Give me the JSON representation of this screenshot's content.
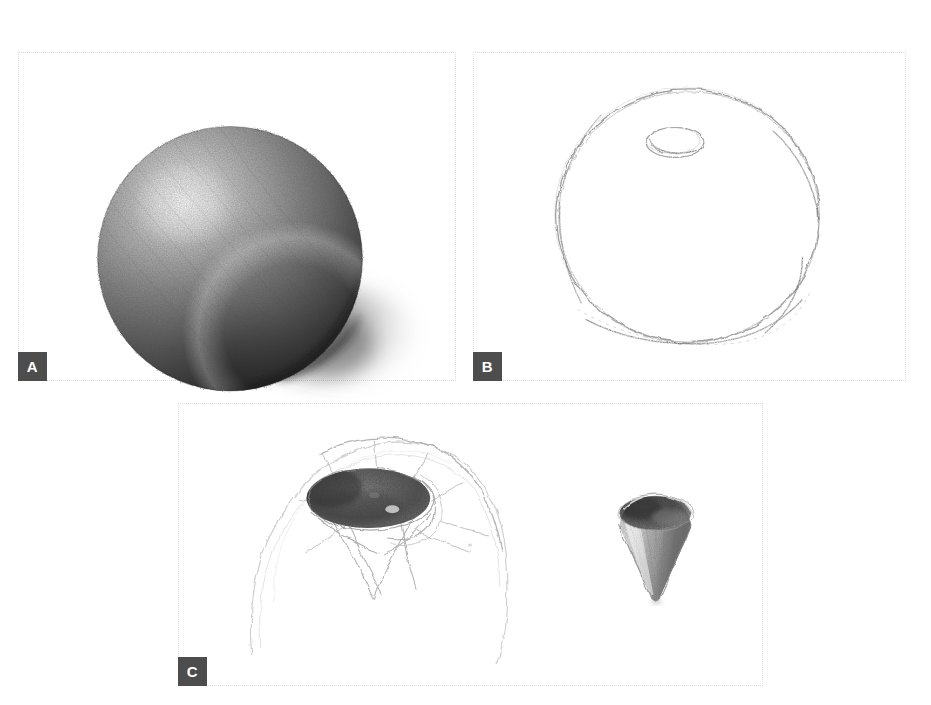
{
  "figure": {
    "kind": "pencil-drawing-plate",
    "background_color": "#ffffff",
    "panel_border_color": "#dcdcdc",
    "badge_background": "#4d4d4d",
    "badge_text_color": "#ffffff",
    "graphite_dark": "#2b2b2b",
    "graphite_mid": "#6e6e6e",
    "graphite_light": "#b9b9b9",
    "outline_gray": "#9a9a9a"
  },
  "panels": [
    {
      "id": "A",
      "label": "A",
      "badge_label": "A",
      "caption": "",
      "frame": {
        "x": 18,
        "y": 52,
        "w": 438,
        "h": 329
      },
      "content_name": "shaded-sphere",
      "subjects": [
        {
          "name": "sphere",
          "shape": "sphere",
          "cx": 212,
          "cy": 207,
          "rx": 133,
          "ry": 133,
          "highlight": {
            "cx": 165,
            "cy": 150,
            "r": 52
          },
          "value_range": [
            "#f2f2f2",
            "#1d1d1d"
          ]
        },
        {
          "name": "cast-shadow",
          "shape": "ellipse",
          "cx": 330,
          "cy": 285,
          "rx": 68,
          "ry": 46
        }
      ]
    },
    {
      "id": "B",
      "label": "B",
      "badge_label": "B",
      "caption": "",
      "frame": {
        "x": 473,
        "y": 52,
        "w": 433,
        "h": 329
      },
      "content_name": "contour-outline-sphere",
      "subjects": [
        {
          "name": "outline-circle",
          "shape": "circle-contour",
          "cx": 215,
          "cy": 165,
          "rx": 132,
          "ry": 128
        },
        {
          "name": "stem-cavity-oval",
          "shape": "small-oval",
          "cx": 203,
          "cy": 90,
          "rx": 29,
          "ry": 15
        }
      ]
    },
    {
      "id": "C",
      "label": "C",
      "badge_label": "C",
      "caption": "",
      "frame": {
        "x": 178,
        "y": 403,
        "w": 585,
        "h": 283
      },
      "content_name": "detail-studies",
      "subjects": [
        {
          "name": "dome-with-stem-cavity",
          "shape": "dome",
          "cx": 200,
          "cy": 140,
          "rx": 128,
          "ry": 112,
          "cavity": {
            "cx": 190,
            "cy": 95,
            "rx": 62,
            "ry": 30
          },
          "radiating_lines": 8
        },
        {
          "name": "cone-funnel",
          "shape": "inverted-cone",
          "cx": 478,
          "cy": 130,
          "rx": 36,
          "h": 66
        }
      ]
    }
  ]
}
